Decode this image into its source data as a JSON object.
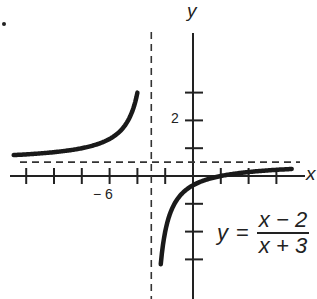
{
  "chart_data": {
    "type": "line",
    "title": "",
    "function": "y = (x - 2)/(x + 3)",
    "xlabel": "x",
    "ylabel": "y",
    "xlim": [
      -14,
      8.5
    ],
    "ylim": [
      -8.5,
      12.5
    ],
    "tick_labels": {
      "x": [
        {
          "value": -6,
          "text": "− 6"
        }
      ],
      "y": [
        {
          "value": 2,
          "text": "2"
        }
      ]
    },
    "x_ticks": [
      -12,
      -10,
      -8,
      -6,
      -4,
      -2,
      2,
      4,
      6
    ],
    "y_ticks": [
      -6,
      -4,
      -2,
      2,
      4,
      6
    ],
    "asymptotes": {
      "vertical": -3,
      "horizontal": 1,
      "style": "dashed"
    },
    "series": [
      {
        "name": "left branch",
        "x": [
          -12.9,
          -11,
          -9,
          -7,
          -6,
          -5,
          -4.5,
          -4
        ],
        "y": [
          1.5,
          1.63,
          1.83,
          2.25,
          2.67,
          3.5,
          4.33,
          6.0
        ]
      },
      {
        "name": "right branch",
        "x": [
          -2.3,
          -2,
          -1,
          0,
          1,
          2,
          3,
          4,
          5,
          6,
          7
        ],
        "y": [
          -6.14,
          -4.0,
          -1.5,
          -0.67,
          -0.25,
          0,
          0.17,
          0.29,
          0.38,
          0.44,
          0.5
        ]
      }
    ],
    "grid": false,
    "legend": null
  },
  "labels": {
    "y_axis": "y",
    "x_axis": "x",
    "y_tick_2": "2",
    "x_tick_neg6": "− 6"
  },
  "equation": {
    "lhs": "y",
    "eq": "=",
    "numerator": "x − 2",
    "denominator": "x + 3"
  },
  "colors": {
    "ink": "#222222",
    "background": "#ffffff"
  }
}
